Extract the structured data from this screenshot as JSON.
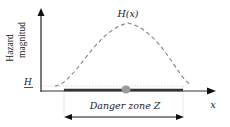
{
  "diagram": {
    "y_axis_label_line1": "Hazard",
    "y_axis_label_line2": "magnitud",
    "threshold_label": "H",
    "curve_label": "H(x)",
    "x_axis_label": "x",
    "zone_label": "Danger zone Z",
    "colors": {
      "axis": "#222222",
      "curve": "#777777",
      "zone_bar": "#333333",
      "marker": "#999999",
      "threshold_line": "#cccccc",
      "text": "#222222"
    }
  }
}
